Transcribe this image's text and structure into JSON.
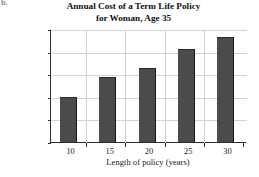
{
  "part_label": "b.",
  "chart_data": {
    "type": "bar",
    "title": "Annual Cost of a Term Life Policy for Woman, Age 35",
    "title_lines": [
      "Annual Cost of a Term Life Policy",
      "for Woman, Age 35"
    ],
    "xlabel": "Length of policy (years)",
    "ylabel": "Cost ($)",
    "categories": [
      "10",
      "15",
      "20",
      "25",
      "30"
    ],
    "values": [
      100,
      143,
      163,
      205,
      232
    ],
    "ylim": [
      0,
      250
    ],
    "yticks": [
      0,
      50,
      100,
      150,
      200,
      250
    ],
    "ytick_labels": [
      "0",
      "50",
      "100",
      "150",
      "200",
      "250"
    ],
    "xtick_labels": [
      "10",
      "15",
      "20",
      "25",
      "30"
    ],
    "grid": true,
    "legend": null,
    "bar_color": "#4b4b4b",
    "grid_color": "#d2d2d2",
    "axis_color": "#2b2b2b"
  }
}
